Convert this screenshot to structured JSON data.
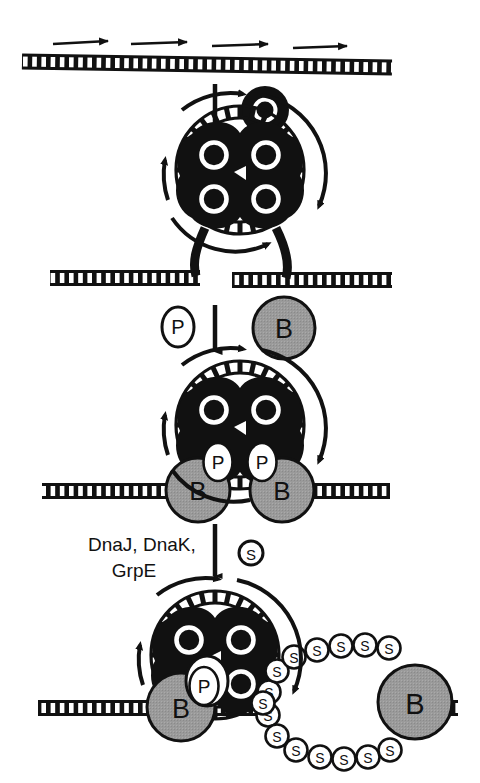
{
  "figure": {
    "background_color": "#ffffff",
    "ink_color": "#111111",
    "protein_gray": "#9a9a9a",
    "protein_white": "#ffffff"
  },
  "stages": [
    {
      "id": "stage-1",
      "name": "naked-dna-with-transcription-arrows",
      "dna_label": "duplex DNA ladder",
      "arrow_count": 4,
      "arrow_direction": "right"
    },
    {
      "id": "stage-2",
      "name": "o-protein-tetramer-looped-dna",
      "o_count": 4,
      "o_letter": "O",
      "loop_arrows": 2
    },
    {
      "id": "stage-3",
      "name": "o-p-b-complex",
      "o_count": 2,
      "o_letter": "O",
      "p_letter": "P",
      "p_count": 2,
      "b_letter": "B",
      "b_count": 2
    },
    {
      "id": "stage-4",
      "name": "ssb-coated-unwound-dna",
      "o_count": 4,
      "o_letter": "O",
      "p_letter": "P",
      "p_count": 1,
      "b_letter": "B",
      "b_count": 2,
      "s_letter": "S",
      "s_count": 17
    }
  ],
  "free_proteins": {
    "o_glyph": "O",
    "p_glyph": "P",
    "b_glyph": "B",
    "s_glyph": "S"
  },
  "annotations": {
    "chaperones_line1": "DnaJ, DnaK,",
    "chaperones_line2": "GrpE",
    "ssb_marker": "S"
  },
  "transition_arrows": [
    {
      "id": "arrow-1-2",
      "direction": "down"
    },
    {
      "id": "arrow-2-3",
      "direction": "down"
    },
    {
      "id": "arrow-3-4",
      "direction": "down"
    }
  ]
}
